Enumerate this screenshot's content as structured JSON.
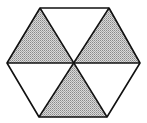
{
  "diagram": {
    "type": "hexagon-divided-into-triangles",
    "stroke_color": "#111111",
    "shade_color": "#bdbdbd",
    "background_color": "#ffffff",
    "center": [
      73,
      63
    ],
    "vertices": {
      "top_left": [
        40,
        8
      ],
      "top_right": [
        109,
        8
      ],
      "right": [
        140,
        63
      ],
      "bottom_right": [
        107,
        117
      ],
      "bottom_left": [
        39,
        117
      ],
      "left": [
        7,
        63
      ]
    },
    "triangles": [
      {
        "name": "top",
        "shaded": false
      },
      {
        "name": "upper-right",
        "shaded": true
      },
      {
        "name": "lower-right",
        "shaded": false
      },
      {
        "name": "bottom",
        "shaded": true
      },
      {
        "name": "lower-left",
        "shaded": false
      },
      {
        "name": "upper-left",
        "shaded": true
      }
    ]
  }
}
